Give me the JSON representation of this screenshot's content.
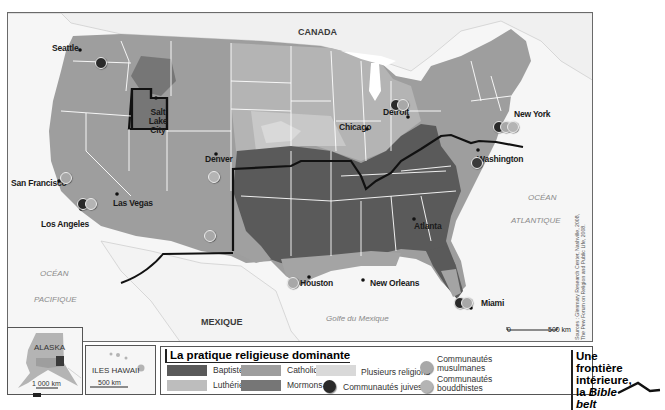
{
  "map": {
    "colors": {
      "baptistes": "#5a5a5a",
      "lutheriens": "#bdbdbd",
      "catholiques": "#9e9e9e",
      "mormons": "#767676",
      "plusieurs": "#d9d9d9",
      "juives": "#2a2a2a",
      "musulmanes": "#a8a8a8",
      "bouddhistes": "#b4b4b4",
      "water": "#f6f6f6",
      "border": "#ffffff",
      "bible_belt": "#111111"
    },
    "countries": {
      "canada": "CANADA",
      "mexique": "MEXIQUE"
    },
    "water_labels": {
      "ocean_pacific_1": "OCÉAN",
      "ocean_pacific_2": "PACIFIQUE",
      "ocean_atlantic_1": "OCÉAN",
      "ocean_atlantic_2": "ATLANTIQUE",
      "gulf": "Golfe du Mexique"
    },
    "cities": [
      {
        "name": "Seattle"
      },
      {
        "name": "San Francisco"
      },
      {
        "name": "Los Angeles"
      },
      {
        "name": "Las Vegas"
      },
      {
        "name": "Salt Lake City"
      },
      {
        "name": "Denver"
      },
      {
        "name": "Chicago"
      },
      {
        "name": "Detroit"
      },
      {
        "name": "New York"
      },
      {
        "name": "Washington"
      },
      {
        "name": "Atlanta"
      },
      {
        "name": "Houston"
      },
      {
        "name": "New Orleans"
      },
      {
        "name": "Miami"
      }
    ],
    "scale": {
      "zero": "0",
      "label": "500 km"
    },
    "sources": {
      "line1": "Sources : Glenmary Research Center, Nashville, 2008,",
      "line2": "The Pew Forum on Religion and Public Life, 2008."
    }
  },
  "insets": {
    "alaska": {
      "name": "ALASKA",
      "scale": "1 000 km"
    },
    "hawaii": {
      "name": "ILES HAWAII",
      "scale": "500 km"
    }
  },
  "legend": {
    "title": "La pratique religieuse dominante",
    "items": [
      {
        "label": "Baptistes"
      },
      {
        "label": "Luthériens"
      },
      {
        "label": "Catholiques"
      },
      {
        "label": "Mormons"
      },
      {
        "label": "Plusieurs religions"
      },
      {
        "label": "Communautés juives"
      },
      {
        "label": "Communautés musulmanes",
        "line1": "Communautés",
        "line2": "musulmanes"
      },
      {
        "label": "Communautés bouddhistes",
        "line1": "Communautés",
        "line2": "bouddhistes"
      }
    ],
    "bible_belt": {
      "line1": "Une frontière",
      "line2_prefix": "intérieure, la ",
      "line2_italic": "Bible belt"
    }
  }
}
